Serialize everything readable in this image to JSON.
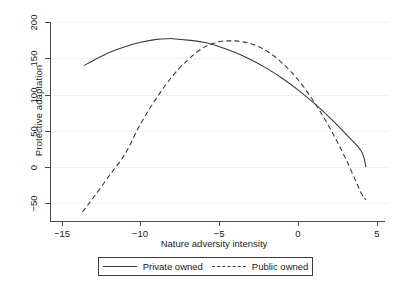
{
  "chart_data": {
    "type": "line",
    "title": "",
    "subtitle": "",
    "xlabel": "Nature adversity intensity",
    "ylabel": "Protective adaptation",
    "xlim": [
      -15,
      5
    ],
    "ylim": [
      -65,
      215
    ],
    "xticks": [
      -15,
      -10,
      -5,
      0,
      5
    ],
    "xtick_labels": [
      "−15",
      "−10",
      "−5",
      "0",
      "5"
    ],
    "yticks": [
      -50,
      0,
      50,
      100,
      150,
      200
    ],
    "ytick_labels": [
      "−50",
      "0",
      "50",
      "100",
      "150",
      "200"
    ],
    "grid": "horizontal-faint",
    "legend_position": "below-plot",
    "series": [
      {
        "name": "Private owned",
        "style": "solid",
        "color": "#3a3a3a",
        "x": [
          -13.6,
          -13.0,
          -12.0,
          -11.0,
          -10.0,
          -9.0,
          -8.2,
          -8.0,
          -7.0,
          -6.0,
          -5.0,
          -4.0,
          -3.0,
          -2.0,
          -1.0,
          0.0,
          1.0,
          2.0,
          3.0,
          4.0,
          4.3
        ],
        "y": [
          140,
          147,
          158,
          166,
          172,
          176,
          177,
          177,
          175,
          172,
          166,
          158,
          148,
          136,
          122,
          106,
          88,
          68,
          46,
          22,
          0
        ]
      },
      {
        "name": "Public owned",
        "style": "dashed",
        "color": "#3a3a3a",
        "x": [
          -13.7,
          -13.0,
          -12.0,
          -11.0,
          -10.0,
          -9.0,
          -8.0,
          -7.0,
          -6.0,
          -5.0,
          -4.3,
          -4.0,
          -3.0,
          -2.0,
          -1.0,
          0.0,
          1.0,
          2.0,
          3.0,
          4.0,
          4.3
        ],
        "y": [
          -62,
          -42,
          -12,
          18,
          60,
          95,
          125,
          148,
          165,
          173,
          174,
          174,
          170,
          160,
          143,
          120,
          90,
          54,
          12,
          -36,
          -45
        ]
      }
    ],
    "legend": [
      {
        "label": "Private owned",
        "style": "solid"
      },
      {
        "label": "Public owned",
        "style": "dashed"
      }
    ]
  }
}
